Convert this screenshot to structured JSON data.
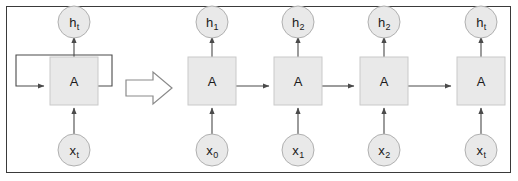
{
  "figure": {
    "border_color": "#3a3a3a",
    "background": "#ffffff"
  },
  "style": {
    "node_fill": "#e9e9e9",
    "node_stroke": "#b0b0b0",
    "cell_fill": "#e9e9e9",
    "cell_stroke": "#c9c9c9",
    "edge_color": "#4a4a4a",
    "big_arrow_fill": "#ffffff",
    "big_arrow_stroke": "#8a8a8a"
  },
  "folded": {
    "cell_label": "A",
    "input": {
      "base": "x",
      "sub": "t"
    },
    "output": {
      "base": "h",
      "sub": "t"
    },
    "loop_label": ""
  },
  "transform_arrow": {
    "glyph": "right-arrow",
    "label": ""
  },
  "unrolled": {
    "cells": [
      {
        "cell_label": "A",
        "input": {
          "base": "x",
          "sub": "0"
        },
        "output": {
          "base": "h",
          "sub": "1"
        }
      },
      {
        "cell_label": "A",
        "input": {
          "base": "x",
          "sub": "1"
        },
        "output": {
          "base": "h",
          "sub": "2"
        }
      },
      {
        "cell_label": "A",
        "input": {
          "base": "x",
          "sub": "2"
        },
        "output": {
          "base": "h",
          "sub": "2"
        }
      },
      {
        "cell_label": "A",
        "input": {
          "base": "x",
          "sub": "t"
        },
        "output": {
          "base": "h",
          "sub": "t"
        }
      }
    ]
  }
}
